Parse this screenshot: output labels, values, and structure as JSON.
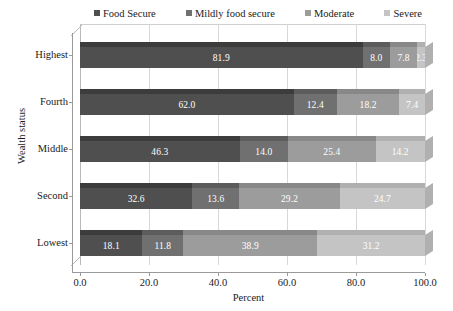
{
  "chart_data": {
    "type": "bar",
    "orientation": "horizontal",
    "stacked": true,
    "stack_mode": "percent",
    "title": "",
    "xlabel": "Percent",
    "ylabel": "Wealth status",
    "xlim": [
      0,
      100
    ],
    "xticks": [
      "0.0",
      "20.0",
      "40.0",
      "60.0",
      "80.0",
      "100.0"
    ],
    "xtick_values": [
      0,
      20,
      40,
      60,
      80,
      100
    ],
    "grid": true,
    "grid_axis": "x",
    "legend_position": "top",
    "categories": [
      "Highest",
      "Fourth",
      "Middle",
      "Second",
      "Lowest"
    ],
    "series": [
      {
        "name": "Food Secure",
        "color": "#4f4f4f",
        "top_color": "#3c3c3c",
        "values": [
          81.9,
          62.0,
          46.3,
          32.6,
          18.1
        ],
        "labels": [
          "81.9",
          "62.0",
          "46.3",
          "32.6",
          "18.1"
        ]
      },
      {
        "name": "Mildly food secure",
        "color": "#707070",
        "top_color": "#5c5c5c",
        "values": [
          8.0,
          12.4,
          14.0,
          13.6,
          11.8
        ],
        "labels": [
          "8.0",
          "12.4",
          "14.0",
          "13.6",
          "11.8"
        ]
      },
      {
        "name": "Moderate",
        "color": "#9c9c9c",
        "top_color": "#888888",
        "values": [
          7.8,
          18.2,
          25.4,
          29.2,
          38.9
        ],
        "labels": [
          "7.8",
          "18.2",
          "25.4",
          "29.2",
          "38.9"
        ]
      },
      {
        "name": "Severe",
        "color": "#c4c4c4",
        "top_color": "#b0b0b0",
        "values": [
          2.3,
          7.4,
          14.2,
          24.7,
          31.2
        ],
        "labels": [
          "2.3",
          "7.4",
          "14.2",
          "24.7",
          "31.2"
        ]
      }
    ],
    "rows": [
      {
        "category": "Highest",
        "values": [
          81.9,
          8.0,
          7.8,
          2.3
        ],
        "labels": [
          "81.9",
          "8.0",
          "7.8",
          "2.3"
        ]
      },
      {
        "category": "Fourth",
        "values": [
          62.0,
          12.4,
          18.2,
          7.4
        ],
        "labels": [
          "62.0",
          "12.4",
          "18.2",
          "7.4"
        ]
      },
      {
        "category": "Middle",
        "values": [
          46.3,
          14.0,
          25.4,
          14.2
        ],
        "labels": [
          "46.3",
          "14.0",
          "25.4",
          "14.2"
        ]
      },
      {
        "category": "Second",
        "values": [
          32.6,
          13.6,
          29.2,
          24.7
        ],
        "labels": [
          "32.6",
          "13.6",
          "29.2",
          "24.7"
        ]
      },
      {
        "category": "Lowest",
        "values": [
          18.1,
          11.8,
          38.9,
          31.2
        ],
        "labels": [
          "18.1",
          "11.8",
          "38.9",
          "31.2"
        ]
      }
    ]
  },
  "legend": {
    "items": [
      {
        "label": "Food Secure",
        "marker": "square-swatch-icon",
        "color": "#4f4f4f"
      },
      {
        "label": "Mildly food secure",
        "marker": "square-swatch-icon",
        "color": "#707070"
      },
      {
        "label": "Moderate",
        "marker": "square-swatch-icon",
        "color": "#9c9c9c"
      },
      {
        "label": "Severe",
        "marker": "square-swatch-icon",
        "color": "#c4c4c4"
      }
    ]
  },
  "axes": {
    "x_title": "Percent",
    "y_title": "Wealth status",
    "x_tick_labels": [
      "0.0",
      "20.0",
      "40.0",
      "60.0",
      "80.0",
      "100.0"
    ],
    "y_tick_labels": [
      "Highest",
      "Fourth",
      "Middle",
      "Second",
      "Lowest"
    ]
  }
}
